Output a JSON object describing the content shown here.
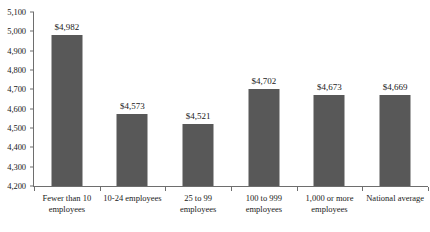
{
  "chart_data": {
    "type": "bar",
    "title": "",
    "subtitle": "",
    "xlabel": "",
    "ylabel": "",
    "ylim": [
      4200,
      5100
    ],
    "y_tick_step": 100,
    "grid": false,
    "legend": false,
    "legend_position": "none",
    "bar_color": "#585858",
    "axis_color": "#6e6e6e",
    "categories": [
      "Fewer than 10 employees",
      "10-24 employees",
      "25 to 99 employees",
      "100 to 999 employees",
      "1,000 or more employees",
      "National average"
    ],
    "values": [
      4982,
      4573,
      4521,
      4702,
      4673,
      4669
    ],
    "data_labels": [
      "$4,982",
      "$4,573",
      "$4,521",
      "$4,702",
      "$4,673",
      "$4,669"
    ],
    "y_tick_labels": [
      "5,100",
      "5,000",
      "4,900",
      "4,800",
      "4,700",
      "4,600",
      "4,500",
      "4,400",
      "4,300",
      "4,200"
    ],
    "y_tick_values": [
      5100,
      5000,
      4900,
      4800,
      4700,
      4600,
      4500,
      4400,
      4300,
      4200
    ]
  }
}
